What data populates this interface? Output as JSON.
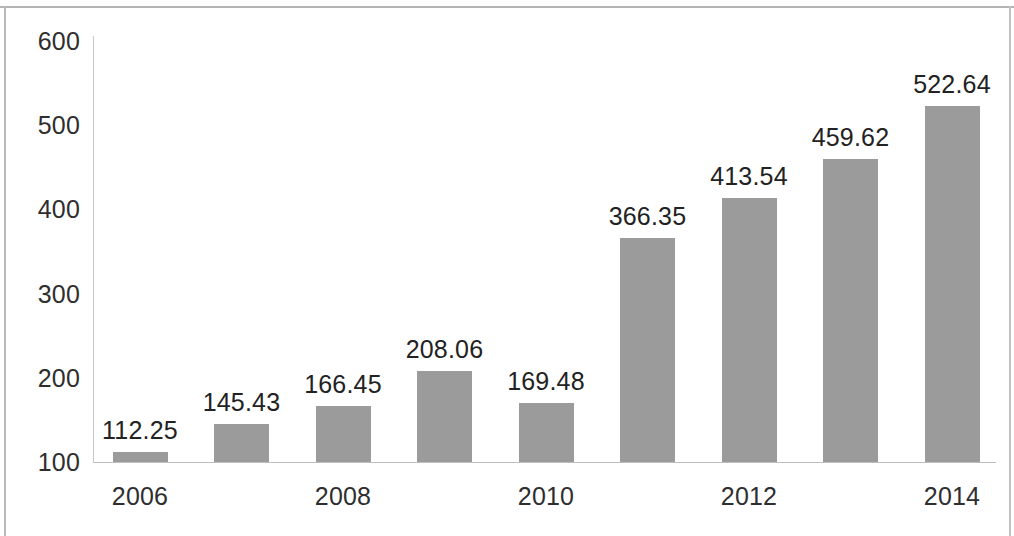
{
  "chart_data": {
    "type": "bar",
    "title": "",
    "subtitle": "",
    "xlabel": "",
    "ylabel": "",
    "categories": [
      "2006",
      "2007",
      "2008",
      "2009",
      "2010",
      "2011",
      "2012",
      "2013",
      "2014"
    ],
    "values": [
      112.25,
      145.43,
      166.45,
      208.06,
      169.48,
      366.35,
      413.54,
      459.62,
      522.64
    ],
    "data_labels": [
      "112.25",
      "145.43",
      "166.45",
      "208.06",
      "169.48",
      "366.35",
      "413.54",
      "459.62",
      "522.64"
    ],
    "series": [
      {
        "name": "",
        "values": [
          112.25,
          145.43,
          166.45,
          208.06,
          169.48,
          366.35,
          413.54,
          459.62,
          522.64
        ]
      }
    ],
    "y_ticks": [
      "600",
      "500",
      "400",
      "300",
      "200",
      "100"
    ],
    "y_tick_values": [
      600,
      500,
      400,
      300,
      200,
      100
    ],
    "ylim": [
      100,
      600
    ],
    "x_tick_labels": [
      "2006",
      "2008",
      "2010",
      "2012",
      "2014"
    ],
    "x_tick_categories": [
      "2006",
      "2008",
      "2010",
      "2012",
      "2014"
    ],
    "grid": false,
    "legend": false,
    "legend_position": "none",
    "bar_color": "#9b9b9b",
    "axis_color": "#c2c2c2",
    "text_color": "#2e2e2e",
    "background_color": "#ffffff"
  }
}
